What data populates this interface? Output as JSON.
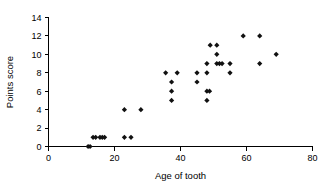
{
  "chart_data": {
    "type": "scatter",
    "title": "",
    "xlabel": "Age of tooth",
    "ylabel": "Points score",
    "xlim": [
      0,
      80
    ],
    "ylim": [
      0,
      14
    ],
    "xticks": [
      0,
      20,
      40,
      60,
      80
    ],
    "yticks": [
      0,
      2,
      4,
      6,
      8,
      10,
      12,
      14
    ],
    "xtick_labels": [
      "0",
      "20",
      "40",
      "60",
      "80"
    ],
    "ytick_labels": [
      "0",
      "2",
      "4",
      "6",
      "8",
      "10",
      "12",
      "14"
    ],
    "grid": false,
    "legend": false,
    "marker": "diamond",
    "marker_color": "#111111",
    "series": [
      {
        "name": "Tooth age vs points score",
        "points": [
          [
            12,
            0
          ],
          [
            12.6,
            0
          ],
          [
            13.5,
            1
          ],
          [
            14.3,
            1
          ],
          [
            15.6,
            1
          ],
          [
            16.3,
            1
          ],
          [
            17,
            1
          ],
          [
            23,
            1
          ],
          [
            25,
            1
          ],
          [
            23,
            4
          ],
          [
            28,
            4
          ],
          [
            35.5,
            8
          ],
          [
            37.3,
            6
          ],
          [
            37.3,
            7
          ],
          [
            37.3,
            5
          ],
          [
            39,
            8
          ],
          [
            45,
            8
          ],
          [
            45,
            7
          ],
          [
            48,
            9
          ],
          [
            48,
            8
          ],
          [
            48,
            6
          ],
          [
            48.8,
            6
          ],
          [
            48,
            5
          ],
          [
            49,
            11
          ],
          [
            51,
            11
          ],
          [
            51,
            10
          ],
          [
            51,
            9
          ],
          [
            51.8,
            9
          ],
          [
            52.6,
            9
          ],
          [
            55,
            9
          ],
          [
            55,
            8
          ],
          [
            59,
            12
          ],
          [
            64,
            12
          ],
          [
            64,
            9
          ],
          [
            69,
            10
          ]
        ]
      }
    ]
  },
  "axes": {
    "x_axis_name": "x-axis",
    "y_axis_name": "y-axis"
  }
}
